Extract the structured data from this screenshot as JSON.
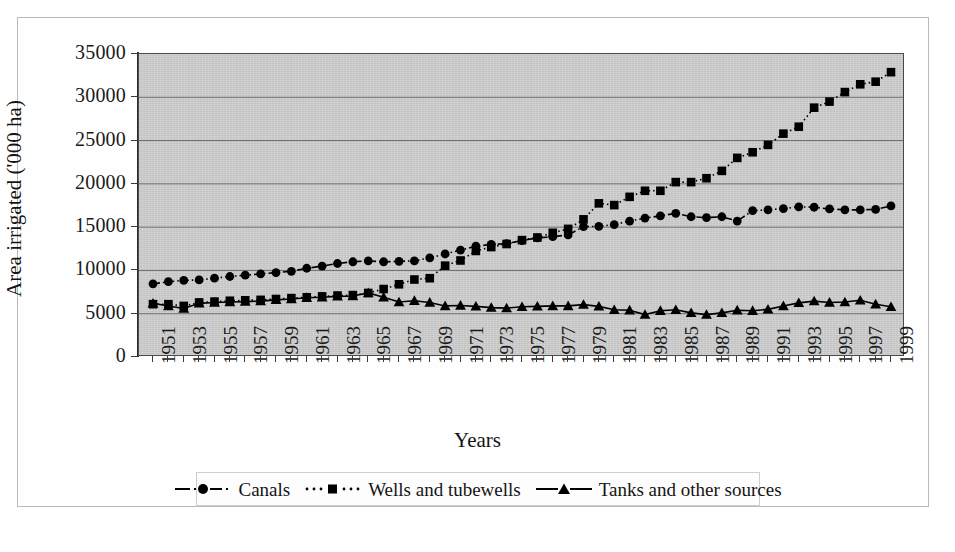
{
  "chart_data": {
    "type": "line",
    "title": "",
    "xlabel": "Years",
    "ylabel": "Area irrigated ('000 ha)",
    "xlim": [
      1950,
      2000
    ],
    "ylim": [
      0,
      35000
    ],
    "ytick_values": [
      0,
      5000,
      10000,
      15000,
      20000,
      25000,
      30000,
      35000
    ],
    "ytick_labels": [
      "0",
      "5000",
      "10000",
      "15000",
      "20000",
      "25000",
      "30000",
      "35000"
    ],
    "xtick_labels": [
      "1951",
      "1953",
      "1955",
      "1957",
      "1959",
      "1961",
      "1963",
      "1965",
      "1967",
      "1969",
      "1971",
      "1973",
      "1975",
      "1977",
      "1979",
      "1981",
      "1983",
      "1985",
      "1987",
      "1989",
      "1991",
      "1993",
      "1995",
      "1997",
      "1999"
    ],
    "x": [
      1951,
      1952,
      1953,
      1954,
      1955,
      1956,
      1957,
      1958,
      1959,
      1960,
      1961,
      1962,
      1963,
      1964,
      1965,
      1966,
      1967,
      1968,
      1969,
      1970,
      1971,
      1972,
      1973,
      1974,
      1975,
      1976,
      1977,
      1978,
      1979,
      1980,
      1981,
      1982,
      1983,
      1984,
      1985,
      1986,
      1987,
      1988,
      1989,
      1990,
      1991,
      1992,
      1993,
      1994,
      1995,
      1996,
      1997,
      1998,
      1999
    ],
    "grid": true,
    "grid_axis": "y",
    "legend_position": "bottom",
    "plot_background": "#c9c9c9",
    "series": [
      {
        "name": "Canals",
        "marker": "circle",
        "linestyle": "dash-dot",
        "color": "#000000",
        "values": [
          8450,
          8700,
          8850,
          8900,
          9100,
          9300,
          9450,
          9600,
          9750,
          9900,
          10250,
          10500,
          10800,
          11000,
          11100,
          11000,
          11050,
          11100,
          11450,
          11900,
          12350,
          12800,
          13000,
          13100,
          13450,
          13750,
          13900,
          14100,
          15050,
          15100,
          15300,
          15700,
          16050,
          16300,
          16600,
          16200,
          16100,
          16200,
          15700,
          16900,
          17000,
          17150,
          17350,
          17300,
          17100,
          17000,
          17000,
          17050,
          17450
        ]
      },
      {
        "name": "Wells and tubewells",
        "marker": "square",
        "linestyle": "dotted",
        "color": "#000000",
        "values": [
          6100,
          6100,
          5900,
          6300,
          6400,
          6500,
          6550,
          6600,
          6700,
          6800,
          6900,
          7000,
          7100,
          7150,
          7400,
          7850,
          8400,
          8950,
          9100,
          10550,
          11150,
          12250,
          12700,
          13050,
          13500,
          13800,
          14350,
          14800,
          15900,
          17750,
          17550,
          18500,
          19200,
          19200,
          20200,
          20200,
          20650,
          21500,
          23000,
          23650,
          24500,
          25800,
          26600,
          28800,
          29500,
          30600,
          31500,
          31800,
          32900
        ]
      },
      {
        "name": "Tanks and other sources",
        "marker": "triangle",
        "linestyle": "solid",
        "color": "#000000",
        "values": [
          6200,
          5900,
          5600,
          6200,
          6300,
          6350,
          6400,
          6450,
          6600,
          6700,
          6850,
          6900,
          7000,
          7050,
          7400,
          6900,
          6350,
          6500,
          6300,
          5900,
          5950,
          5850,
          5700,
          5650,
          5800,
          5850,
          5900,
          5900,
          6050,
          5850,
          5450,
          5400,
          4900,
          5350,
          5450,
          5100,
          4900,
          5100,
          5400,
          5350,
          5500,
          5900,
          6250,
          6450,
          6300,
          6350,
          6550,
          6100,
          5800
        ]
      }
    ]
  },
  "axes": {
    "y_title": "Area irrigated ('000 ha)",
    "x_title": "Years"
  },
  "legend": {
    "entries": [
      {
        "label": "Canals",
        "marker": "circle",
        "linestyle": "dash-dot"
      },
      {
        "label": "Wells and tubewells",
        "marker": "square",
        "linestyle": "dotted"
      },
      {
        "label": "Tanks and other sources",
        "marker": "triangle",
        "linestyle": "solid"
      }
    ]
  }
}
